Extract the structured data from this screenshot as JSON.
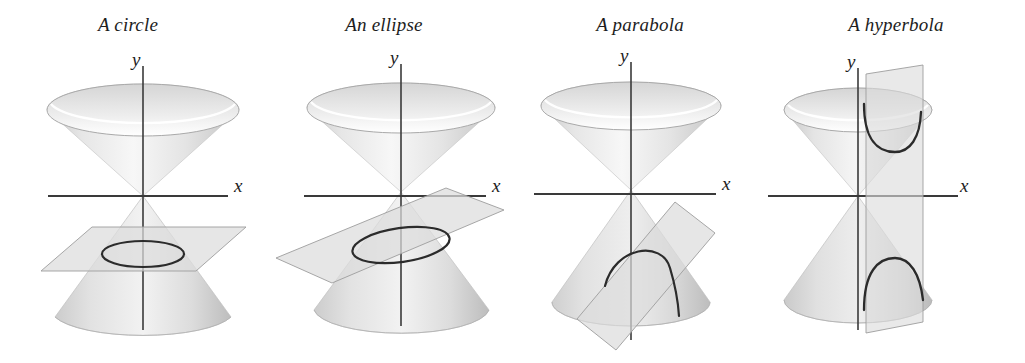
{
  "figure": {
    "name": "conic-sections-figure",
    "background_color": "#ffffff",
    "width": 1025,
    "height": 363,
    "axis_color": "#333333",
    "curve_color": "#2b2b2b",
    "plane_fill": "#dcdcdc",
    "plane_edge": "#9a9a9a",
    "cone_light": "#f3f3f3",
    "cone_mid": "#d9d9d9",
    "cone_dark": "#b9b9b9"
  },
  "panels": [
    {
      "id": "circle",
      "title": "A circle",
      "x_label": "x",
      "y_label": "y",
      "plane_orientation": "horizontal",
      "curve": "circle"
    },
    {
      "id": "ellipse",
      "title": "An ellipse",
      "x_label": "x",
      "y_label": "y",
      "plane_orientation": "tilted",
      "curve": "ellipse"
    },
    {
      "id": "parabola",
      "title": "A parabola",
      "x_label": "x",
      "y_label": "y",
      "plane_orientation": "slanted-parallel-to-generator",
      "curve": "parabola"
    },
    {
      "id": "hyperbola",
      "title": "A hyperbola",
      "x_label": "x",
      "y_label": "y",
      "plane_orientation": "vertical",
      "curve": "hyperbola"
    }
  ]
}
